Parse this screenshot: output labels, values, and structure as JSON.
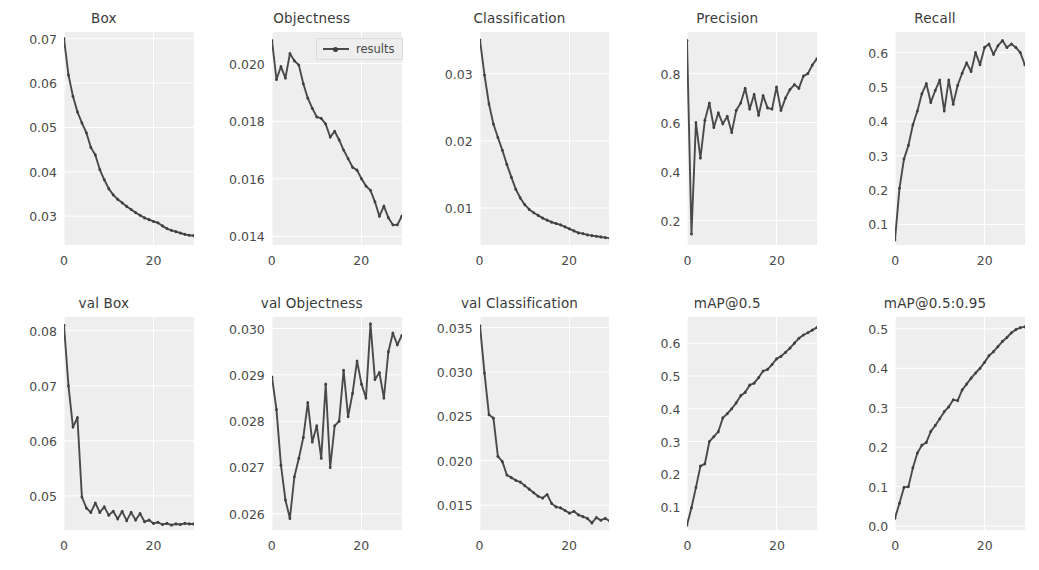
{
  "figure": {
    "title": "",
    "rows": 2,
    "cols": 5,
    "background": "#ffffff",
    "panel_background": "#eeeeee",
    "line_color": "#4a4a4a",
    "grid_color": "#ffffff",
    "legend": {
      "label": "results",
      "position": "upper-center-of-objectness-panel",
      "visible_in_panel": "Objectness"
    },
    "xlabel": "",
    "shared_xticks": [
      "0",
      "20"
    ]
  },
  "chart_data": [
    {
      "type": "line",
      "title": "Box",
      "xlabel": "",
      "ylabel": "",
      "xlim": [
        0,
        29
      ],
      "ylim": [
        0.0235,
        0.0715
      ],
      "xticks": [
        0,
        20
      ],
      "xticklabels": [
        "0",
        "20"
      ],
      "yticks": [
        0.03,
        0.04,
        0.05,
        0.06,
        0.07
      ],
      "yticklabels": [
        "0.03",
        "0.04",
        "0.05",
        "0.06",
        "0.07"
      ],
      "grid": true,
      "legend": "results",
      "x": [
        0,
        1,
        2,
        3,
        4,
        5,
        6,
        7,
        8,
        9,
        10,
        11,
        12,
        13,
        14,
        15,
        16,
        17,
        18,
        19,
        20,
        21,
        22,
        23,
        24,
        25,
        26,
        27,
        28,
        29
      ],
      "values": [
        0.07,
        0.0618,
        0.057,
        0.0535,
        0.051,
        0.0488,
        0.0455,
        0.0438,
        0.0405,
        0.0382,
        0.0362,
        0.0348,
        0.0338,
        0.033,
        0.0322,
        0.0315,
        0.0308,
        0.0302,
        0.0296,
        0.0292,
        0.0288,
        0.0285,
        0.0278,
        0.0272,
        0.0268,
        0.0265,
        0.0262,
        0.0259,
        0.0257,
        0.0256
      ]
    },
    {
      "type": "line",
      "title": "Objectness",
      "xlabel": "",
      "ylabel": "",
      "xlim": [
        0,
        29
      ],
      "ylim": [
        0.0137,
        0.0211
      ],
      "xticks": [
        0,
        20
      ],
      "xticklabels": [
        "0",
        "20"
      ],
      "yticks": [
        0.014,
        0.016,
        0.018,
        0.02
      ],
      "yticklabels": [
        "0.014",
        "0.016",
        "0.018",
        "0.020"
      ],
      "grid": true,
      "legend": "results",
      "x": [
        0,
        1,
        2,
        3,
        4,
        5,
        6,
        7,
        8,
        9,
        10,
        11,
        12,
        13,
        14,
        15,
        16,
        17,
        18,
        19,
        20,
        21,
        22,
        23,
        24,
        25,
        26,
        27,
        28,
        29
      ],
      "values": [
        0.0208,
        0.01945,
        0.0199,
        0.0195,
        0.02035,
        0.0201,
        0.01995,
        0.0193,
        0.0188,
        0.01845,
        0.01815,
        0.0181,
        0.0179,
        0.01745,
        0.01765,
        0.01735,
        0.017,
        0.0167,
        0.0164,
        0.0163,
        0.016,
        0.01575,
        0.0156,
        0.0152,
        0.0147,
        0.01505,
        0.01465,
        0.0144,
        0.0144,
        0.0147
      ]
    },
    {
      "type": "line",
      "title": "Classification",
      "xlabel": "",
      "ylabel": "",
      "xlim": [
        0,
        29
      ],
      "ylim": [
        0.0045,
        0.0362
      ],
      "xticks": [
        0,
        20
      ],
      "xticklabels": [
        "0",
        "20"
      ],
      "yticks": [
        0.01,
        0.02,
        0.03
      ],
      "yticklabels": [
        "0.01",
        "0.02",
        "0.03"
      ],
      "grid": true,
      "legend": "results",
      "x": [
        0,
        1,
        2,
        3,
        4,
        5,
        6,
        7,
        8,
        9,
        10,
        11,
        12,
        13,
        14,
        15,
        16,
        17,
        18,
        19,
        20,
        21,
        22,
        23,
        24,
        25,
        26,
        27,
        28,
        29
      ],
      "values": [
        0.035,
        0.0298,
        0.0255,
        0.0225,
        0.0205,
        0.0186,
        0.0165,
        0.0146,
        0.0128,
        0.0115,
        0.0105,
        0.0098,
        0.0093,
        0.0089,
        0.0085,
        0.0082,
        0.0079,
        0.0077,
        0.0075,
        0.0072,
        0.0069,
        0.0066,
        0.0063,
        0.0062,
        0.006,
        0.0059,
        0.0058,
        0.0057,
        0.0056,
        0.0055
      ]
    },
    {
      "type": "line",
      "title": "Precision",
      "xlabel": "",
      "ylabel": "",
      "xlim": [
        0,
        29
      ],
      "ylim": [
        0.1,
        0.97
      ],
      "xticks": [
        0,
        20
      ],
      "xticklabels": [
        "0",
        "20"
      ],
      "yticks": [
        0.2,
        0.4,
        0.6,
        0.8
      ],
      "yticklabels": [
        "0.2",
        "0.4",
        "0.6",
        "0.8"
      ],
      "grid": true,
      "legend": "results",
      "x": [
        0,
        1,
        2,
        3,
        4,
        5,
        6,
        7,
        8,
        9,
        10,
        11,
        12,
        13,
        14,
        15,
        16,
        17,
        18,
        19,
        20,
        21,
        22,
        23,
        24,
        25,
        26,
        27,
        28,
        29
      ],
      "values": [
        0.935,
        0.145,
        0.6,
        0.455,
        0.61,
        0.68,
        0.58,
        0.64,
        0.595,
        0.625,
        0.56,
        0.65,
        0.68,
        0.74,
        0.655,
        0.715,
        0.63,
        0.71,
        0.66,
        0.655,
        0.745,
        0.65,
        0.7,
        0.735,
        0.755,
        0.74,
        0.79,
        0.8,
        0.835,
        0.86
      ]
    },
    {
      "type": "line",
      "title": "Recall",
      "xlabel": "",
      "ylabel": "",
      "xlim": [
        0,
        29
      ],
      "ylim": [
        0.04,
        0.66
      ],
      "xticks": [
        0,
        20
      ],
      "xticklabels": [
        "0",
        "20"
      ],
      "yticks": [
        0.1,
        0.2,
        0.3,
        0.4,
        0.5,
        0.6
      ],
      "yticklabels": [
        "0.1",
        "0.2",
        "0.3",
        "0.4",
        "0.5",
        "0.6"
      ],
      "grid": true,
      "legend": "results",
      "x": [
        0,
        1,
        2,
        3,
        4,
        5,
        6,
        7,
        8,
        9,
        10,
        11,
        12,
        13,
        14,
        15,
        16,
        17,
        18,
        19,
        20,
        21,
        22,
        23,
        24,
        25,
        26,
        27,
        28,
        29
      ],
      "values": [
        0.055,
        0.205,
        0.29,
        0.33,
        0.39,
        0.43,
        0.48,
        0.51,
        0.455,
        0.49,
        0.52,
        0.43,
        0.52,
        0.45,
        0.505,
        0.54,
        0.57,
        0.545,
        0.6,
        0.565,
        0.615,
        0.625,
        0.595,
        0.62,
        0.635,
        0.615,
        0.625,
        0.615,
        0.6,
        0.565
      ]
    },
    {
      "type": "line",
      "title": "val Box",
      "xlabel": "",
      "ylabel": "",
      "xlim": [
        0,
        29
      ],
      "ylim": [
        0.0438,
        0.0825
      ],
      "xticks": [
        0,
        20
      ],
      "xticklabels": [
        "0",
        "20"
      ],
      "yticks": [
        0.05,
        0.06,
        0.07,
        0.08
      ],
      "yticklabels": [
        "0.05",
        "0.06",
        "0.07",
        "0.08"
      ],
      "grid": true,
      "legend": "results",
      "x": [
        0,
        1,
        2,
        3,
        4,
        5,
        6,
        7,
        8,
        9,
        10,
        11,
        12,
        13,
        14,
        15,
        16,
        17,
        18,
        19,
        20,
        21,
        22,
        23,
        24,
        25,
        26,
        27,
        28,
        29
      ],
      "values": [
        0.081,
        0.07,
        0.0625,
        0.0642,
        0.0498,
        0.0478,
        0.047,
        0.0487,
        0.047,
        0.048,
        0.0465,
        0.0472,
        0.0458,
        0.0472,
        0.0455,
        0.047,
        0.0456,
        0.0468,
        0.0453,
        0.0456,
        0.045,
        0.0452,
        0.0448,
        0.045,
        0.0447,
        0.0449,
        0.0448,
        0.045,
        0.0449,
        0.0449
      ]
    },
    {
      "type": "line",
      "title": "val Objectness",
      "xlabel": "",
      "ylabel": "",
      "xlim": [
        0,
        29
      ],
      "ylim": [
        0.02565,
        0.03025
      ],
      "xticks": [
        0,
        20
      ],
      "xticklabels": [
        "0",
        "20"
      ],
      "yticks": [
        0.026,
        0.027,
        0.028,
        0.029,
        0.03
      ],
      "yticklabels": [
        "0.026",
        "0.027",
        "0.028",
        "0.029",
        "0.030"
      ],
      "grid": true,
      "legend": "results",
      "x": [
        0,
        1,
        2,
        3,
        4,
        5,
        6,
        7,
        8,
        9,
        10,
        11,
        12,
        13,
        14,
        15,
        16,
        17,
        18,
        19,
        20,
        21,
        22,
        23,
        24,
        25,
        26,
        27,
        28,
        29
      ],
      "values": [
        0.02895,
        0.02825,
        0.02705,
        0.0263,
        0.0259,
        0.0268,
        0.0272,
        0.02765,
        0.0284,
        0.02755,
        0.0279,
        0.0272,
        0.0288,
        0.027,
        0.0279,
        0.028,
        0.0291,
        0.0281,
        0.0286,
        0.0293,
        0.0288,
        0.0285,
        0.0301,
        0.0289,
        0.02905,
        0.0285,
        0.0295,
        0.0299,
        0.02965,
        0.02985
      ]
    },
    {
      "type": "line",
      "title": "val Classification",
      "xlabel": "",
      "ylabel": "",
      "xlim": [
        0,
        29
      ],
      "ylim": [
        0.0122,
        0.0362
      ],
      "xticks": [
        0,
        20
      ],
      "xticklabels": [
        "0",
        "20"
      ],
      "yticks": [
        0.015,
        0.02,
        0.025,
        0.03,
        0.035
      ],
      "yticklabels": [
        "0.015",
        "0.020",
        "0.025",
        "0.030",
        "0.035"
      ],
      "grid": true,
      "legend": "results",
      "x": [
        0,
        1,
        2,
        3,
        4,
        5,
        6,
        7,
        8,
        9,
        10,
        11,
        12,
        13,
        14,
        15,
        16,
        17,
        18,
        19,
        20,
        21,
        22,
        23,
        24,
        25,
        26,
        27,
        28,
        29
      ],
      "values": [
        0.0352,
        0.0299,
        0.0252,
        0.0248,
        0.0205,
        0.0199,
        0.0184,
        0.0181,
        0.0178,
        0.0176,
        0.0172,
        0.0168,
        0.0164,
        0.016,
        0.0158,
        0.0162,
        0.0152,
        0.0148,
        0.0147,
        0.0144,
        0.0141,
        0.0143,
        0.0139,
        0.0137,
        0.0135,
        0.013,
        0.0136,
        0.0133,
        0.0135,
        0.0132
      ]
    },
    {
      "type": "line",
      "title": "mAP@0.5",
      "xlabel": "",
      "ylabel": "",
      "xlim": [
        0,
        29
      ],
      "ylim": [
        0.03,
        0.68
      ],
      "xticks": [
        0,
        20
      ],
      "xticklabels": [
        "0",
        "20"
      ],
      "yticks": [
        0.1,
        0.2,
        0.3,
        0.4,
        0.5,
        0.6
      ],
      "yticklabels": [
        "0.1",
        "0.2",
        "0.3",
        "0.4",
        "0.5",
        "0.6"
      ],
      "grid": true,
      "legend": "results",
      "x": [
        0,
        1,
        2,
        3,
        4,
        5,
        6,
        7,
        8,
        9,
        10,
        11,
        12,
        13,
        14,
        15,
        16,
        17,
        18,
        19,
        20,
        21,
        22,
        23,
        24,
        25,
        26,
        27,
        28,
        29
      ],
      "values": [
        0.045,
        0.098,
        0.16,
        0.225,
        0.232,
        0.3,
        0.315,
        0.33,
        0.372,
        0.385,
        0.4,
        0.418,
        0.44,
        0.45,
        0.472,
        0.478,
        0.495,
        0.515,
        0.52,
        0.535,
        0.552,
        0.56,
        0.572,
        0.585,
        0.6,
        0.615,
        0.625,
        0.632,
        0.64,
        0.648
      ]
    },
    {
      "type": "line",
      "title": "mAP@0.5:0.95",
      "xlabel": "",
      "ylabel": "",
      "xlim": [
        0,
        29
      ],
      "ylim": [
        -0.01,
        0.53
      ],
      "xticks": [
        0,
        20
      ],
      "xticklabels": [
        "0",
        "20"
      ],
      "yticks": [
        0.0,
        0.1,
        0.2,
        0.3,
        0.4,
        0.5
      ],
      "yticklabels": [
        "0.0",
        "0.1",
        "0.2",
        "0.3",
        "0.4",
        "0.5"
      ],
      "grid": true,
      "legend": "results",
      "x": [
        0,
        1,
        2,
        3,
        4,
        5,
        6,
        7,
        8,
        9,
        10,
        11,
        12,
        13,
        14,
        15,
        16,
        17,
        18,
        19,
        20,
        21,
        22,
        23,
        24,
        25,
        26,
        27,
        28,
        29
      ],
      "values": [
        0.02,
        0.058,
        0.098,
        0.1,
        0.148,
        0.185,
        0.205,
        0.212,
        0.24,
        0.255,
        0.272,
        0.29,
        0.302,
        0.32,
        0.318,
        0.345,
        0.36,
        0.375,
        0.388,
        0.4,
        0.415,
        0.432,
        0.442,
        0.455,
        0.468,
        0.478,
        0.49,
        0.498,
        0.503,
        0.505
      ]
    }
  ]
}
